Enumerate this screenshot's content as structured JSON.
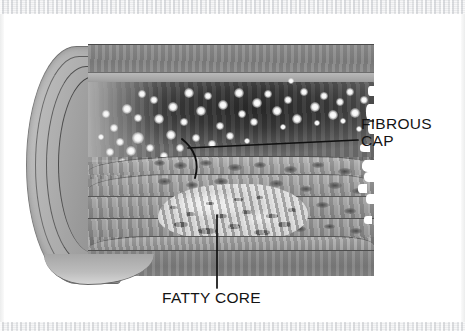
{
  "figure": {
    "kind": "medical-illustration",
    "rendering": "grayscale-halftone-scan",
    "canvas": {
      "width": 465,
      "height": 331,
      "background": "#ffffff"
    },
    "scan_edges": {
      "top_band_color": "#e9eaec",
      "bottom_band_color": "#ebecee",
      "side_band_color": "#eceded"
    },
    "palette": {
      "paper_white": "#ffffff",
      "lumen_dark": "#2b2b2b",
      "outer_wall_gray": "#7e7e7e",
      "fiber_gray": "#9d9d9d",
      "fatty_core_light": "#e4e4e4",
      "ink_black": "#141414"
    }
  },
  "annotations": {
    "fibrous_cap": {
      "label_line_1": "FIBROUS",
      "label_line_2": "CAP",
      "leader": {
        "from_x": 188,
        "from_y": 148,
        "to_x": 358,
        "to_y": 140,
        "bracket": "curved"
      }
    },
    "fatty_core": {
      "label": "FATTY CORE",
      "leader": {
        "from_x": 217,
        "from_y": 215,
        "to_x": 217,
        "to_y": 288,
        "bracket": "none"
      }
    }
  },
  "structures": [
    {
      "name": "adventitia",
      "region": "bottom-band",
      "tone": "dark-gray"
    },
    {
      "name": "media",
      "region": "lower-middle",
      "tone": "mid-gray"
    },
    {
      "name": "fatty-core",
      "region": "lower-center",
      "tone": "light-mottled"
    },
    {
      "name": "fibrous-cap",
      "region": "mid-left",
      "tone": "mid-gray-wavy"
    },
    {
      "name": "lumen",
      "region": "upper-center",
      "tone": "near-black-with-specks"
    },
    {
      "name": "intima",
      "region": "upper-band",
      "tone": "light-gray"
    },
    {
      "name": "vessel-wall-cut-face",
      "region": "left-rounded-edge",
      "tone": "concentric-gray-layers"
    }
  ],
  "specks": [
    [
      34,
      60,
      5
    ],
    [
      50,
      46,
      4
    ],
    [
      66,
      70,
      5
    ],
    [
      22,
      80,
      4
    ],
    [
      44,
      88,
      6
    ],
    [
      62,
      52,
      4
    ],
    [
      80,
      58,
      5
    ],
    [
      96,
      44,
      5
    ],
    [
      14,
      66,
      4
    ],
    [
      38,
      102,
      5
    ],
    [
      58,
      100,
      4
    ],
    [
      78,
      86,
      5
    ],
    [
      92,
      74,
      4
    ],
    [
      108,
      62,
      5
    ],
    [
      116,
      48,
      4
    ],
    [
      130,
      56,
      5
    ],
    [
      128,
      78,
      4
    ],
    [
      146,
      44,
      5
    ],
    [
      150,
      66,
      4
    ],
    [
      164,
      54,
      5
    ],
    [
      162,
      74,
      4
    ],
    [
      176,
      46,
      4
    ],
    [
      184,
      62,
      5
    ],
    [
      196,
      52,
      4
    ],
    [
      204,
      70,
      5
    ],
    [
      212,
      44,
      4
    ],
    [
      222,
      58,
      5
    ],
    [
      232,
      48,
      4
    ],
    [
      240,
      66,
      5
    ],
    [
      248,
      54,
      4
    ],
    [
      258,
      44,
      4
    ],
    [
      262,
      64,
      5
    ],
    [
      272,
      52,
      4
    ],
    [
      28,
      94,
      4
    ],
    [
      72,
      108,
      4
    ],
    [
      18,
      104,
      4
    ],
    [
      46,
      70,
      4
    ],
    [
      88,
      100,
      4
    ],
    [
      104,
      90,
      4
    ],
    [
      120,
      96,
      4
    ],
    [
      138,
      88,
      4
    ],
    [
      156,
      94,
      3
    ],
    [
      30,
      114,
      4
    ],
    [
      52,
      120,
      3
    ],
    [
      10,
      90,
      3
    ],
    [
      192,
      80,
      3
    ],
    [
      226,
      76,
      3
    ],
    [
      252,
      74,
      3
    ],
    [
      268,
      82,
      3
    ],
    [
      200,
      34,
      3
    ]
  ],
  "nuclei": [
    [
      86,
      118,
      13,
      7
    ],
    [
      112,
      116,
      12,
      6
    ],
    [
      140,
      120,
      14,
      7
    ],
    [
      166,
      118,
      12,
      6
    ],
    [
      196,
      122,
      13,
      7
    ],
    [
      224,
      118,
      12,
      6
    ],
    [
      250,
      124,
      14,
      7
    ],
    [
      70,
      134,
      13,
      7
    ],
    [
      98,
      138,
      12,
      6
    ],
    [
      126,
      134,
      14,
      7
    ],
    [
      154,
      140,
      12,
      6
    ],
    [
      182,
      136,
      13,
      7
    ],
    [
      212,
      142,
      12,
      6
    ],
    [
      240,
      138,
      14,
      7
    ],
    [
      264,
      144,
      12,
      6
    ],
    [
      80,
      158,
      13,
      6
    ],
    [
      108,
      162,
      12,
      6
    ],
    [
      136,
      158,
      13,
      6
    ],
    [
      198,
      162,
      12,
      6
    ],
    [
      228,
      158,
      13,
      6
    ],
    [
      256,
      164,
      12,
      6
    ],
    [
      92,
      180,
      12,
      6
    ],
    [
      120,
      184,
      11,
      5
    ],
    [
      206,
      182,
      12,
      6
    ],
    [
      236,
      180,
      11,
      5
    ],
    [
      262,
      184,
      12,
      6
    ],
    [
      66,
      116,
      11,
      6
    ],
    [
      276,
      120,
      11,
      6
    ]
  ],
  "core_flecks": [
    [
      16,
      38,
      14,
      5
    ],
    [
      40,
      44,
      18,
      6
    ],
    [
      70,
      40,
      12,
      5
    ],
    [
      96,
      46,
      16,
      5
    ],
    [
      120,
      38,
      13,
      5
    ],
    [
      28,
      28,
      9,
      4
    ],
    [
      58,
      30,
      11,
      4
    ],
    [
      84,
      26,
      10,
      4
    ],
    [
      108,
      30,
      12,
      4
    ],
    [
      48,
      18,
      8,
      3
    ],
    [
      76,
      14,
      9,
      3
    ],
    [
      12,
      22,
      7,
      3
    ],
    [
      130,
      24,
      8,
      4
    ],
    [
      98,
      12,
      7,
      3
    ]
  ],
  "tears": [
    [
      274,
      116,
      14,
      12
    ],
    [
      276,
      128,
      12,
      10
    ],
    [
      272,
      100,
      10,
      8
    ],
    [
      278,
      60,
      8,
      16
    ],
    [
      280,
      78,
      7,
      12
    ],
    [
      270,
      140,
      9,
      9
    ],
    [
      278,
      150,
      10,
      10
    ],
    [
      276,
      172,
      8,
      8
    ],
    [
      280,
      42,
      6,
      10
    ]
  ]
}
